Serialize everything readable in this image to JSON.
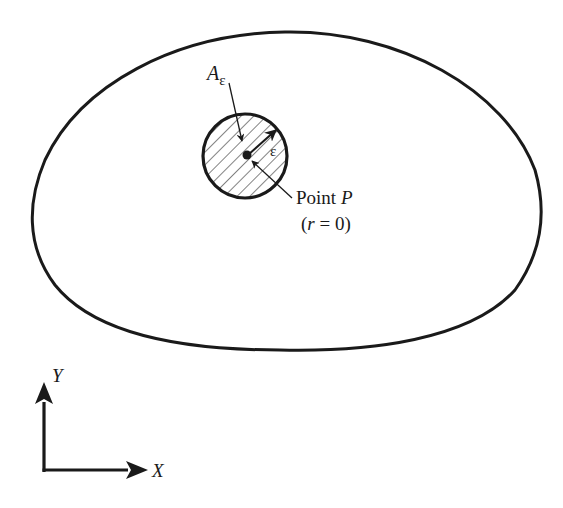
{
  "diagram": {
    "colors": {
      "stroke": "#1a1a1a",
      "background": "#ffffff"
    },
    "region": {
      "description": "closed outer domain boundary"
    },
    "small_area": {
      "label_main": "A",
      "label_sub": "ε",
      "hatched": true
    },
    "radius": {
      "label": "ε"
    },
    "point": {
      "label_prefix": "Point ",
      "label_name": "P",
      "condition_open": "(",
      "condition_var": "r",
      "condition_rest": " = 0)"
    },
    "axes": {
      "x_label": "X",
      "y_label": "Y"
    }
  }
}
